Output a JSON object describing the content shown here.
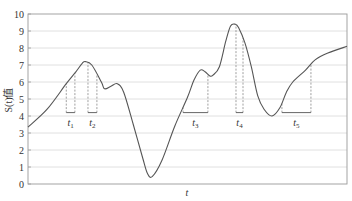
{
  "chart_data": {
    "type": "line",
    "title": "",
    "xlabel": "t",
    "ylabel": "S(t)值",
    "ylim": [
      0,
      10
    ],
    "yticks": [
      0,
      1,
      2,
      3,
      4,
      5,
      6,
      7,
      8,
      9,
      10
    ],
    "grid": "horizontal",
    "legend": null,
    "series": [
      {
        "name": "S(t)",
        "points": [
          [
            0.0,
            3.35
          ],
          [
            0.06,
            4.4
          ],
          [
            0.12,
            5.9
          ],
          [
            0.15,
            6.6
          ],
          [
            0.17,
            7.1
          ],
          [
            0.18,
            7.2
          ],
          [
            0.2,
            7.0
          ],
          [
            0.23,
            6.0
          ],
          [
            0.24,
            5.6
          ],
          [
            0.26,
            5.75
          ],
          [
            0.28,
            5.9
          ],
          [
            0.3,
            5.4
          ],
          [
            0.33,
            3.5
          ],
          [
            0.36,
            1.5
          ],
          [
            0.375,
            0.6
          ],
          [
            0.39,
            0.45
          ],
          [
            0.42,
            1.4
          ],
          [
            0.46,
            3.4
          ],
          [
            0.5,
            5.1
          ],
          [
            0.52,
            6.1
          ],
          [
            0.54,
            6.7
          ],
          [
            0.555,
            6.6
          ],
          [
            0.57,
            6.35
          ],
          [
            0.58,
            6.4
          ],
          [
            0.6,
            6.9
          ],
          [
            0.62,
            8.4
          ],
          [
            0.635,
            9.3
          ],
          [
            0.65,
            9.4
          ],
          [
            0.66,
            9.2
          ],
          [
            0.68,
            8.3
          ],
          [
            0.7,
            6.9
          ],
          [
            0.72,
            5.2
          ],
          [
            0.74,
            4.4
          ],
          [
            0.765,
            4.0
          ],
          [
            0.79,
            4.5
          ],
          [
            0.81,
            5.4
          ],
          [
            0.83,
            6.0
          ],
          [
            0.87,
            6.7
          ],
          [
            0.9,
            7.3
          ],
          [
            0.94,
            7.7
          ],
          [
            1.0,
            8.1
          ]
        ]
      }
    ],
    "intervals": [
      {
        "label": "t1",
        "x_start": 0.12,
        "x_end": 0.147,
        "baseline": 4.2
      },
      {
        "label": "t2",
        "x_start": 0.188,
        "x_end": 0.216,
        "baseline": 4.2
      },
      {
        "label": "t3",
        "x_start": 0.486,
        "x_end": 0.564,
        "baseline": 4.2
      },
      {
        "label": "t4",
        "x_start": 0.652,
        "x_end": 0.674,
        "baseline": 4.2
      },
      {
        "label": "t5",
        "x_start": 0.796,
        "x_end": 0.887,
        "baseline": 4.2
      }
    ]
  },
  "labels": {
    "xlabel": "t",
    "ylabel": "S(t)值",
    "intervals": [
      "t1",
      "t2",
      "t3",
      "t4",
      "t5"
    ]
  },
  "colors": {
    "curve": "#555555",
    "grid": "#d8d8d8",
    "frame": "#9a9a9a",
    "dashed": "#888888"
  }
}
